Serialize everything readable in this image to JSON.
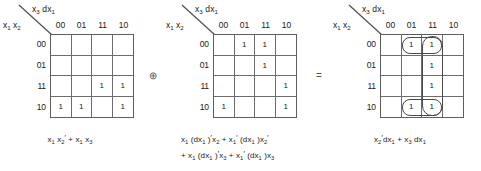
{
  "figure": {
    "type": "karnaugh-map-derivation",
    "line_color": "#6d6d6d",
    "text_color": "#1a1a1a",
    "background": "#ffffff"
  },
  "operators": {
    "xor": "⊕",
    "equals": "="
  },
  "maps": [
    {
      "id": "map-1",
      "top_label": "x₃ dx₁",
      "left_label": "x₁ x₂",
      "col_headers": [
        "00",
        "01",
        "11",
        "10"
      ],
      "row_headers": [
        "00",
        "01",
        "11",
        "10"
      ],
      "cells": [
        [
          "",
          "",
          "",
          ""
        ],
        [
          "",
          "",
          "",
          ""
        ],
        [
          "",
          "",
          "1",
          "1"
        ],
        [
          "1",
          "1",
          "",
          "1"
        ]
      ],
      "caption_lines": [
        "x₁ x₂′ + x₁ x₃"
      ],
      "groups": []
    },
    {
      "id": "map-2",
      "top_label": "x₃ dx₁",
      "left_label": "x₁ x₂",
      "col_headers": [
        "00",
        "01",
        "11",
        "10"
      ],
      "row_headers": [
        "00",
        "01",
        "11",
        "10"
      ],
      "cells": [
        [
          "",
          "1",
          "1",
          ""
        ],
        [
          "",
          "",
          "1",
          ""
        ],
        [
          "",
          "",
          "",
          "1"
        ],
        [
          "1",
          "",
          "",
          "1"
        ]
      ],
      "caption_lines": [
        "x₁ (dx₁ )′x₂ + x₁′ (dx₁ )x₂′",
        "+ x₁ (dx₁ )′x₃ + x₁′ (dx₁ )x₃"
      ],
      "groups": []
    },
    {
      "id": "map-3",
      "top_label": "x₃ dx₁",
      "left_label": "x₁ x₂",
      "col_headers": [
        "00",
        "01",
        "11",
        "10"
      ],
      "row_headers": [
        "00",
        "01",
        "11",
        "10"
      ],
      "cells": [
        [
          "",
          "1",
          "1",
          ""
        ],
        [
          "",
          "",
          "1",
          ""
        ],
        [
          "",
          "",
          "1",
          ""
        ],
        [
          "",
          "1",
          "1",
          ""
        ]
      ],
      "caption_lines": [
        "x₂′dx₁  +  x₃ dx₁"
      ],
      "groups": [
        {
          "name": "column-11-group",
          "shape": "rounded-rect",
          "x": 42,
          "y": 2,
          "w": 21,
          "h": 80
        },
        {
          "name": "row-00-pair-group",
          "shape": "rounded-rect",
          "x": 22,
          "y": 3,
          "w": 40,
          "h": 16
        },
        {
          "name": "row-10-pair-group",
          "shape": "rounded-rect",
          "x": 22,
          "y": 66,
          "w": 40,
          "h": 16
        }
      ]
    }
  ]
}
